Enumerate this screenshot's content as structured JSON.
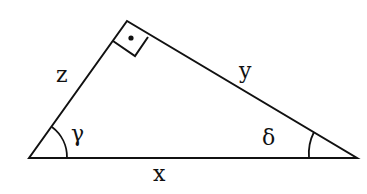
{
  "diagram": {
    "type": "right-triangle",
    "vertices": {
      "left": [
        29,
        158
      ],
      "top": [
        127,
        21
      ],
      "right": [
        357,
        158
      ]
    },
    "right_angle_at": "top",
    "sides": {
      "z": "z",
      "y": "y",
      "x": "x"
    },
    "angles": {
      "gamma": "γ",
      "delta": "δ"
    },
    "colors": {
      "stroke": "#111111",
      "background": "#ffffff"
    }
  }
}
